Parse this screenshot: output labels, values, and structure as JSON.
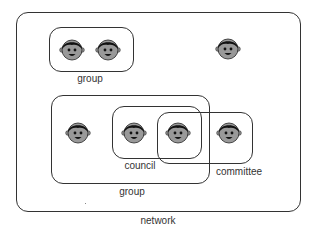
{
  "diagram": {
    "network": {
      "label": "network"
    },
    "groups": [
      {
        "label": "group"
      },
      {
        "label": "group"
      }
    ],
    "council": {
      "label": "council"
    },
    "committee": {
      "label": "committee"
    },
    "people": [
      {
        "icon": "person-face-icon",
        "container": "group-1"
      },
      {
        "icon": "person-face-icon",
        "container": "group-1"
      },
      {
        "icon": "person-face-icon",
        "container": "network"
      },
      {
        "icon": "person-face-icon",
        "container": "group-2"
      },
      {
        "icon": "person-face-icon",
        "container": "council"
      },
      {
        "icon": "person-face-icon",
        "container": "council+committee"
      },
      {
        "icon": "person-face-icon",
        "container": "committee"
      }
    ],
    "colors": {
      "line": "#333333",
      "face": "#999999",
      "hair": "#111111"
    }
  }
}
